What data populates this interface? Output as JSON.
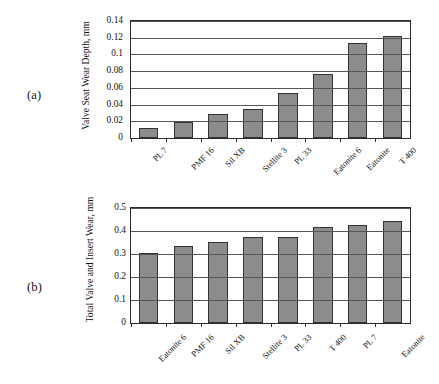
{
  "figure": {
    "panel_a_tag": "(a)",
    "panel_b_tag": "(b)"
  },
  "chart_data": [
    {
      "type": "bar",
      "panel": "(a)",
      "title": "",
      "xlabel": "",
      "ylabel": "Valve Seat Wear Depth, mm",
      "ylim": [
        0,
        0.14
      ],
      "yticks": [
        "0",
        "0.02",
        "0.04",
        "0.06",
        "0.08",
        "0.1",
        "0.12",
        "0.14"
      ],
      "ytick_values": [
        0,
        0.02,
        0.04,
        0.06,
        0.08,
        0.1,
        0.12,
        0.14
      ],
      "grid": true,
      "legend": "none",
      "categories": [
        "PL 7",
        "PMF 16",
        "Sil XB",
        "Stellite 3",
        "PL 33",
        "Eatonite 6",
        "Eatonite",
        "T 400"
      ],
      "values": [
        0.0125,
        0.0197,
        0.0288,
        0.0343,
        0.0543,
        0.0765,
        0.1135,
        0.1225
      ],
      "bar_color": "#8c8c8c",
      "bar_edge_color": "#333333"
    },
    {
      "type": "bar",
      "panel": "(b)",
      "title": "",
      "xlabel": "",
      "ylabel": "Total Valve and Insert Wear, mm",
      "ylim": [
        0,
        0.5
      ],
      "yticks": [
        "0",
        "0.1",
        "0.2",
        "0.3",
        "0.4",
        "0.5"
      ],
      "ytick_values": [
        0,
        0.1,
        0.2,
        0.3,
        0.4,
        0.5
      ],
      "grid": true,
      "legend": "none",
      "categories": [
        "Eatonite 6",
        "PMF 16",
        "Sil XB",
        "Stellite 3",
        "PL 33",
        "T 400",
        "PL 7",
        "Eatonite"
      ],
      "values": [
        0.303,
        0.335,
        0.353,
        0.373,
        0.372,
        0.417,
        0.427,
        0.442
      ],
      "bar_color": "#8c8c8c",
      "bar_edge_color": "#333333"
    }
  ]
}
